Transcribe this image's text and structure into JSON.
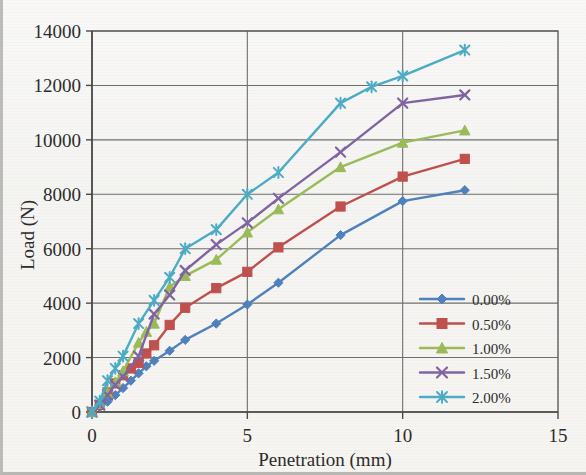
{
  "chart_data": {
    "type": "line",
    "title": "",
    "xlabel": "Penetration (mm)",
    "ylabel": "Load (N)",
    "xlim": [
      0,
      15
    ],
    "ylim": [
      0,
      14000
    ],
    "xticks": [
      0,
      5,
      10,
      15
    ],
    "yticks": [
      0,
      2000,
      4000,
      6000,
      8000,
      10000,
      12000,
      14000
    ],
    "xtick_labels": [
      "0",
      "5",
      "10",
      "15"
    ],
    "ytick_labels": [
      "0",
      "2000",
      "4000",
      "6000",
      "8000",
      "10000",
      "12000",
      "14000"
    ],
    "grid": "horizontal-and-vertical",
    "legend_position": "inside-lower-right",
    "series": [
      {
        "name": "0.00%",
        "color": "#4F81BD",
        "marker": "diamond",
        "x": [
          0,
          0.25,
          0.5,
          0.75,
          1.0,
          1.25,
          1.5,
          1.75,
          2.0,
          2.5,
          3.0,
          4.0,
          5.0,
          6.0,
          8.0,
          10.0,
          12.0
        ],
        "y": [
          0,
          180,
          380,
          620,
          880,
          1150,
          1420,
          1680,
          1880,
          2250,
          2650,
          3250,
          3950,
          4750,
          6500,
          7750,
          8150
        ]
      },
      {
        "name": "0.50%",
        "color": "#C0504D",
        "marker": "square",
        "x": [
          0,
          0.25,
          0.5,
          0.75,
          1.0,
          1.25,
          1.5,
          1.75,
          2.0,
          2.5,
          3.0,
          4.0,
          5.0,
          6.0,
          8.0,
          10.0,
          12.0
        ],
        "y": [
          0,
          260,
          720,
          1050,
          1350,
          1600,
          1800,
          2150,
          2450,
          3200,
          3830,
          4550,
          5150,
          6050,
          7550,
          8650,
          9300
        ]
      },
      {
        "name": "1.00%",
        "color": "#9BBB59",
        "marker": "triangle",
        "x": [
          0,
          0.25,
          0.5,
          0.75,
          1.0,
          1.5,
          1.75,
          2.0,
          2.5,
          3.0,
          4.0,
          5.0,
          6.0,
          8.0,
          10.0,
          12.0
        ],
        "y": [
          0,
          300,
          700,
          1100,
          1500,
          2550,
          2950,
          3250,
          4600,
          5000,
          5600,
          6600,
          7450,
          9000,
          9900,
          10350
        ]
      },
      {
        "name": "1.50%",
        "color": "#8064A2",
        "marker": "x",
        "x": [
          0,
          0.25,
          0.5,
          0.75,
          1.0,
          1.5,
          2.0,
          2.5,
          3.0,
          4.0,
          5.0,
          6.0,
          8.0,
          10.0,
          12.0
        ],
        "y": [
          0,
          250,
          620,
          1000,
          1300,
          2050,
          3600,
          4300,
          5200,
          6150,
          6950,
          7850,
          9550,
          11350,
          11650
        ]
      },
      {
        "name": "2.00%",
        "color": "#4BACC6",
        "marker": "asterisk",
        "x": [
          0,
          0.25,
          0.5,
          0.75,
          1.0,
          1.5,
          2.0,
          2.5,
          3.0,
          4.0,
          5.0,
          6.0,
          8.0,
          9.0,
          10.0,
          12.0
        ],
        "y": [
          0,
          400,
          1150,
          1600,
          2050,
          3250,
          4100,
          4950,
          6000,
          6700,
          8000,
          8800,
          11350,
          11950,
          12350,
          13300
        ]
      }
    ]
  },
  "legend": {
    "entries": [
      {
        "label": "0.00%"
      },
      {
        "label": "0.50%"
      },
      {
        "label": "1.00%"
      },
      {
        "label": "1.50%"
      },
      {
        "label": "2.00%"
      }
    ]
  }
}
